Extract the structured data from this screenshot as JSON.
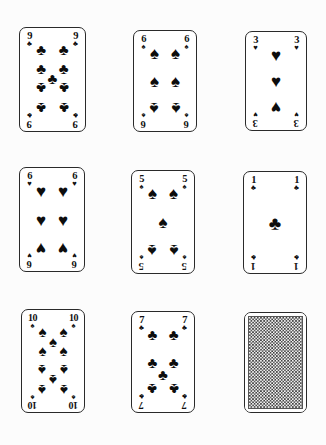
{
  "scene": {
    "title": "Playing cards layout",
    "background_color": "#fcfcfc",
    "ink_color": "#0d0d0d",
    "grid": {
      "rows": 3,
      "columns": 3
    }
  },
  "suit_glyphs": {
    "clubs": "♣",
    "spades": "♠",
    "hearts": "♥",
    "diamonds": "♦"
  },
  "cards": [
    {
      "id": "card-9-clubs",
      "rank": "9",
      "suit": "clubs",
      "suit_glyph": "♣",
      "face_up": true,
      "pip_count": 9,
      "position": {
        "row": 1,
        "column": 1,
        "x": 19,
        "y": 27,
        "width": 67,
        "height": 105
      }
    },
    {
      "id": "card-6-spades",
      "rank": "6",
      "suit": "spades",
      "suit_glyph": "♠",
      "face_up": true,
      "pip_count": 6,
      "position": {
        "row": 1,
        "column": 2,
        "x": 133,
        "y": 30,
        "width": 64,
        "height": 102
      }
    },
    {
      "id": "card-3-hearts",
      "rank": "3",
      "suit": "hearts",
      "suit_glyph": "♥",
      "face_up": true,
      "pip_count": 3,
      "position": {
        "row": 1,
        "column": 3,
        "x": 245,
        "y": 31,
        "width": 62,
        "height": 100
      }
    },
    {
      "id": "card-6-hearts",
      "rank": "6",
      "suit": "hearts",
      "suit_glyph": "♥",
      "face_up": true,
      "pip_count": 6,
      "position": {
        "row": 2,
        "column": 1,
        "x": 19,
        "y": 167,
        "width": 66,
        "height": 105
      }
    },
    {
      "id": "card-5-spades",
      "rank": "5",
      "suit": "spades",
      "suit_glyph": "♠",
      "face_up": true,
      "pip_count": 5,
      "position": {
        "row": 2,
        "column": 2,
        "x": 131,
        "y": 170,
        "width": 64,
        "height": 104
      }
    },
    {
      "id": "card-ace-clubs",
      "rank": "1",
      "suit": "clubs",
      "suit_glyph": "♣",
      "face_up": true,
      "pip_count": 1,
      "position": {
        "row": 2,
        "column": 3,
        "x": 243,
        "y": 171,
        "width": 64,
        "height": 103
      }
    },
    {
      "id": "card-10-spades",
      "rank": "10",
      "suit": "spades",
      "suit_glyph": "♠",
      "face_up": true,
      "pip_count": 10,
      "position": {
        "row": 3,
        "column": 1,
        "x": 21,
        "y": 309,
        "width": 64,
        "height": 104
      }
    },
    {
      "id": "card-7-clubs",
      "rank": "7",
      "suit": "clubs",
      "suit_glyph": "♣",
      "face_up": true,
      "pip_count": 7,
      "position": {
        "row": 3,
        "column": 2,
        "x": 131,
        "y": 311,
        "width": 64,
        "height": 102
      }
    },
    {
      "id": "card-back",
      "rank": "",
      "suit": "",
      "suit_glyph": "",
      "face_up": false,
      "pip_count": 0,
      "pattern": "checkered-weave",
      "position": {
        "row": 3,
        "column": 3,
        "x": 244,
        "y": 312,
        "width": 63,
        "height": 101
      }
    }
  ]
}
